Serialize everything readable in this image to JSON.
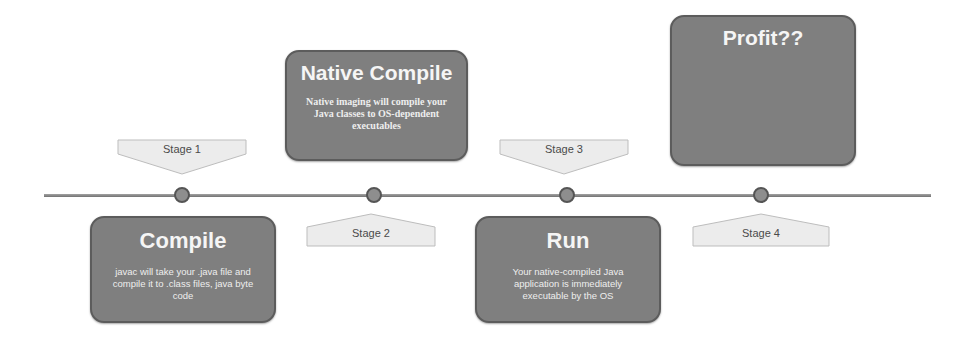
{
  "timeline": {
    "line_color": "#8a8a8a",
    "dot_fill": "#8e8e8e",
    "dot_stroke": "#555555",
    "card_fill": "#7f7f7f",
    "card_stroke": "#5c5c5c",
    "label_fill": "#ececec",
    "label_stroke": "#bdbdbd"
  },
  "stages": [
    {
      "stage_label": "Stage 1",
      "title": "Compile",
      "description": "javac will take your .java file and compile it to .class files, java byte code"
    },
    {
      "stage_label": "Stage 2",
      "title": "Native Compile",
      "description": "Native imaging will compile your Java classes to OS-dependent executables"
    },
    {
      "stage_label": "Stage 3",
      "title": "Run",
      "description": "Your native-compiled Java application is immediately executable by the OS"
    },
    {
      "stage_label": "Stage 4",
      "title": "Profit??",
      "description": ""
    }
  ]
}
